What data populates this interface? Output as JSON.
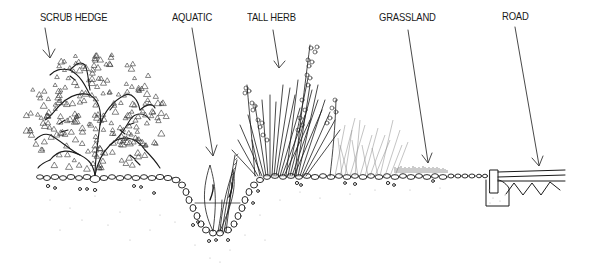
{
  "diagram": {
    "type": "habitat cross-section illustration",
    "colors": {
      "ink": "#1a1a1a",
      "background": "#ffffff",
      "soil_speckle": "#9a9a9a"
    },
    "labels": [
      {
        "id": "scrub-hedge",
        "text": "SCRUB HEDGE",
        "x": 40,
        "y": 17
      },
      {
        "id": "aquatic",
        "text": "AQUATIC",
        "x": 172,
        "y": 17
      },
      {
        "id": "tall-herb",
        "text": "TALL HERB",
        "x": 247,
        "y": 17
      },
      {
        "id": "grassland",
        "text": "GRASSLAND",
        "x": 379,
        "y": 17
      },
      {
        "id": "road",
        "text": "ROAD",
        "x": 502,
        "y": 15
      }
    ],
    "zones": [
      {
        "name": "Scrub hedge",
        "description": "shrub with triangular leaves on stony ground"
      },
      {
        "name": "Aquatic",
        "description": "V-shaped ditch with water line and emergent plants"
      },
      {
        "name": "Tall herb",
        "description": "tall grasses and flowering stems"
      },
      {
        "name": "Grassland",
        "description": "short grass on stony ground"
      },
      {
        "name": "Road",
        "description": "kerb and road surface with zig-zag sub-base"
      }
    ]
  }
}
